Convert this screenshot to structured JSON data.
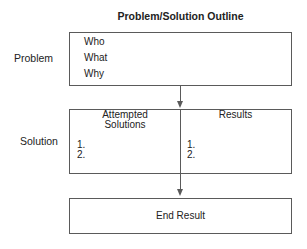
{
  "title": "Problem/Solution Outline",
  "problem": {
    "label": "Problem",
    "items": [
      "Who",
      "What",
      "Why"
    ]
  },
  "solution": {
    "label": "Solution",
    "columns": [
      {
        "header_line1": "Attempted",
        "header_line2": "Solutions",
        "items": [
          "1.",
          "2."
        ]
      },
      {
        "header_line1": "Results",
        "header_line2": "",
        "items": [
          "1.",
          "2."
        ]
      }
    ]
  },
  "end_result": {
    "label": "End Result"
  },
  "colors": {
    "line": "#5a5a5a",
    "text": "#222222",
    "background": "#ffffff"
  }
}
